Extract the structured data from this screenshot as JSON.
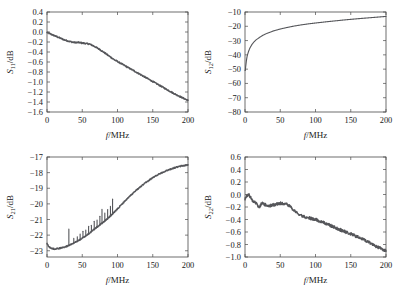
{
  "figure": {
    "background": "#ffffff",
    "curve_color": "#55565a",
    "axis_color": "#4a4a4a"
  },
  "panels": [
    {
      "id": "s11",
      "y_label_sym": "S",
      "y_label_sub": "11",
      "y_label_unit": "/dB",
      "x_label_sym": "f",
      "x_label_unit": "/MHz"
    },
    {
      "id": "s12",
      "y_label_sym": "S",
      "y_label_sub": "12",
      "y_label_unit": "/dB",
      "x_label_sym": "f",
      "x_label_unit": "/MHz"
    },
    {
      "id": "s21",
      "y_label_sym": "S",
      "y_label_sub": "21",
      "y_label_unit": "/dB",
      "x_label_sym": "f",
      "x_label_unit": "/MHz"
    },
    {
      "id": "s22",
      "y_label_sym": "S",
      "y_label_sub": "22",
      "y_label_unit": "/dB",
      "x_label_sym": "f",
      "x_label_unit": "/MHz"
    }
  ],
  "chart_data": [
    {
      "type": "line",
      "id": "s11",
      "title": "",
      "xlabel": "f/MHz",
      "ylabel": "S11/dB",
      "xlim": [
        0,
        200
      ],
      "ylim": [
        -1.6,
        0.4
      ],
      "xticks": [
        0,
        50,
        100,
        150,
        200
      ],
      "yticks": [
        0.4,
        0.2,
        0.0,
        -0.2,
        -0.4,
        -0.6,
        -0.8,
        -1.0,
        -1.2,
        -1.4,
        -1.6
      ],
      "ytick_labels": [
        "0.4",
        "0.2",
        "0.0",
        "-0.2",
        "-0.4",
        "-0.6",
        "-0.8",
        "-1.0",
        "-1.2",
        "-1.4",
        "-1.6"
      ],
      "grid": false,
      "legend": "none",
      "x": [
        0,
        5,
        10,
        15,
        20,
        25,
        30,
        35,
        40,
        45,
        50,
        55,
        60,
        65,
        70,
        75,
        80,
        85,
        90,
        95,
        100,
        110,
        120,
        130,
        140,
        150,
        160,
        170,
        180,
        190,
        200
      ],
      "y": [
        -0.01,
        -0.04,
        -0.07,
        -0.1,
        -0.13,
        -0.16,
        -0.18,
        -0.2,
        -0.21,
        -0.21,
        -0.22,
        -0.23,
        -0.24,
        -0.27,
        -0.31,
        -0.35,
        -0.4,
        -0.45,
        -0.5,
        -0.55,
        -0.59,
        -0.67,
        -0.75,
        -0.83,
        -0.91,
        -0.99,
        -1.07,
        -1.15,
        -1.23,
        -1.3,
        -1.37
      ],
      "noise_amplitude": 0.012
    },
    {
      "type": "line",
      "id": "s12",
      "title": "",
      "xlabel": "f/MHz",
      "ylabel": "S12/dB",
      "xlim": [
        0,
        200
      ],
      "ylim": [
        -80,
        -10
      ],
      "xticks": [
        0,
        50,
        100,
        150,
        200
      ],
      "yticks": [
        -10,
        -20,
        -30,
        -40,
        -50,
        -60,
        -70,
        -80
      ],
      "ytick_labels": [
        "-10",
        "-20",
        "-30",
        "-40",
        "-50",
        "-60",
        "-70",
        "-80"
      ],
      "grid": false,
      "legend": "none",
      "x": [
        0.5,
        1,
        2,
        3,
        4,
        5,
        7,
        10,
        13,
        16,
        20,
        25,
        30,
        40,
        50,
        60,
        70,
        80,
        90,
        100,
        120,
        140,
        160,
        180,
        200
      ],
      "y": [
        -51.0,
        -48.0,
        -44.0,
        -41.0,
        -39.2,
        -37.6,
        -35.2,
        -32.6,
        -30.8,
        -29.4,
        -28.0,
        -26.4,
        -25.2,
        -23.3,
        -21.9,
        -20.8,
        -19.8,
        -19.0,
        -18.3,
        -17.7,
        -16.6,
        -15.6,
        -14.7,
        -13.9,
        -13.1
      ],
      "noise_amplitude": 0.0
    },
    {
      "type": "line",
      "id": "s21",
      "title": "",
      "xlabel": "f/MHz",
      "ylabel": "S21/dB",
      "xlim": [
        0,
        200
      ],
      "ylim": [
        -23.4,
        -17.0
      ],
      "xticks": [
        0,
        50,
        100,
        150,
        200
      ],
      "yticks": [
        -17,
        -18,
        -19,
        -20,
        -21,
        -22,
        -23
      ],
      "ytick_labels": [
        "-17",
        "-18",
        "-19",
        "-20",
        "-21",
        "-22",
        "-23"
      ],
      "grid": false,
      "legend": "none",
      "x": [
        0,
        3,
        6,
        10,
        15,
        20,
        25,
        30,
        35,
        40,
        45,
        50,
        55,
        60,
        65,
        70,
        75,
        80,
        85,
        90,
        95,
        100,
        110,
        120,
        130,
        140,
        150,
        160,
        170,
        180,
        190,
        200
      ],
      "y": [
        -22.55,
        -22.75,
        -22.85,
        -22.88,
        -22.86,
        -22.82,
        -22.76,
        -22.68,
        -22.58,
        -22.46,
        -22.34,
        -22.2,
        -22.05,
        -21.88,
        -21.7,
        -21.52,
        -21.34,
        -21.16,
        -20.98,
        -20.78,
        -20.56,
        -20.32,
        -19.84,
        -19.4,
        -19.0,
        -18.64,
        -18.32,
        -18.06,
        -17.86,
        -17.7,
        -17.58,
        -17.5
      ],
      "noise_amplitude": 0.035,
      "spikes": [
        {
          "x": 31,
          "height": 1.05
        },
        {
          "x": 38,
          "height": 0.3
        },
        {
          "x": 43,
          "height": 0.28
        },
        {
          "x": 47,
          "height": 0.35
        },
        {
          "x": 51,
          "height": 0.42
        },
        {
          "x": 55,
          "height": 0.38
        },
        {
          "x": 59,
          "height": 0.48
        },
        {
          "x": 63,
          "height": 0.4
        },
        {
          "x": 67,
          "height": 0.52
        },
        {
          "x": 71,
          "height": 0.45
        },
        {
          "x": 75,
          "height": 0.55
        },
        {
          "x": 78,
          "height": 0.88
        },
        {
          "x": 82,
          "height": 0.5
        },
        {
          "x": 86,
          "height": 0.58
        },
        {
          "x": 90,
          "height": 0.62
        },
        {
          "x": 93,
          "height": 0.95
        }
      ]
    },
    {
      "type": "line",
      "id": "s22",
      "title": "",
      "xlabel": "f/MHz",
      "ylabel": "S22/dB",
      "xlim": [
        0,
        200
      ],
      "ylim": [
        -1.0,
        0.6
      ],
      "xticks": [
        0,
        50,
        100,
        150,
        200
      ],
      "yticks": [
        0.6,
        0.4,
        0.2,
        0.0,
        -0.2,
        -0.4,
        -0.6,
        -0.8,
        -1.0
      ],
      "ytick_labels": [
        "0.6",
        "0.4",
        "0.2",
        "0.0",
        "-0.2",
        "-0.4",
        "-0.6",
        "-0.8",
        "-1.0"
      ],
      "grid": false,
      "legend": "none",
      "x": [
        0,
        2,
        4,
        6,
        8,
        10,
        12,
        14,
        16,
        18,
        20,
        22,
        24,
        26,
        28,
        30,
        35,
        40,
        45,
        50,
        55,
        60,
        65,
        70,
        75,
        80,
        85,
        90,
        95,
        100,
        110,
        120,
        130,
        140,
        150,
        160,
        170,
        180,
        190,
        200
      ],
      "y": [
        -0.07,
        -0.03,
        0.0,
        -0.01,
        -0.04,
        -0.09,
        -0.13,
        -0.11,
        -0.14,
        -0.19,
        -0.22,
        -0.17,
        -0.14,
        -0.15,
        -0.16,
        -0.17,
        -0.18,
        -0.17,
        -0.15,
        -0.14,
        -0.15,
        -0.16,
        -0.2,
        -0.26,
        -0.31,
        -0.34,
        -0.36,
        -0.37,
        -0.39,
        -0.4,
        -0.44,
        -0.49,
        -0.54,
        -0.59,
        -0.63,
        -0.68,
        -0.73,
        -0.79,
        -0.85,
        -0.9
      ],
      "noise_amplitude": 0.022
    }
  ]
}
